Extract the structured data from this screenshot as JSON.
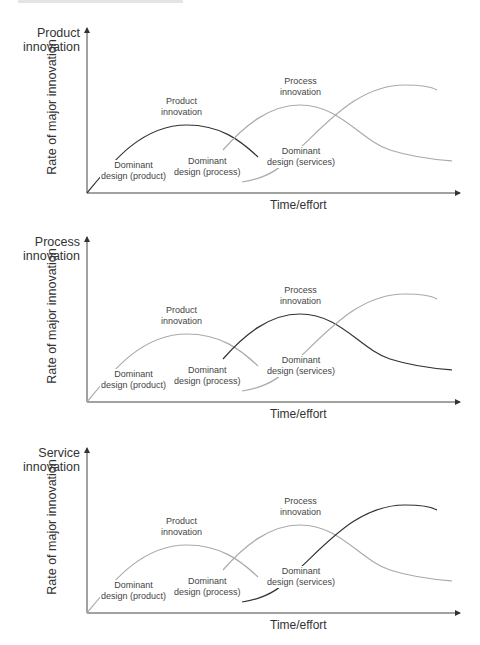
{
  "header": {
    "running_text": ""
  },
  "colors": {
    "highlight": "#333333",
    "muted": "#aaaaaa",
    "axis": "#444444"
  },
  "panels": [
    {
      "focus_label": "Product\ninnovation",
      "y_axis_title": "Rate of major innovation",
      "x_axis_title": "Time/effort",
      "highlighted_curve": "product",
      "labels": {
        "product_peak": "Product\ninnovation",
        "process_peak": "Process\ninnovation",
        "dd_product": "Dominant\ndesign (product)",
        "dd_process": "Dominant\ndesign (process)",
        "dd_services": "Dominant\ndesign (services)"
      }
    },
    {
      "focus_label": "Process\ninnovation",
      "y_axis_title": "Rate of major innovation",
      "x_axis_title": "Time/effort",
      "highlighted_curve": "process",
      "labels": {
        "product_peak": "Product\ninnovation",
        "process_peak": "Process\ninnovation",
        "dd_product": "Dominant\ndesign (product)",
        "dd_process": "Dominant\ndesign (process)",
        "dd_services": "Dominant\ndesign (services)"
      }
    },
    {
      "focus_label": "Service\ninnovation",
      "y_axis_title": "Rate of major innovation",
      "x_axis_title": "Time/effort",
      "highlighted_curve": "services",
      "labels": {
        "product_peak": "Product\ninnovation",
        "process_peak": "Process\ninnovation",
        "dd_product": "Dominant\ndesign (product)",
        "dd_process": "Dominant\ndesign (process)",
        "dd_services": "Dominant\ndesign (services)"
      }
    }
  ]
}
